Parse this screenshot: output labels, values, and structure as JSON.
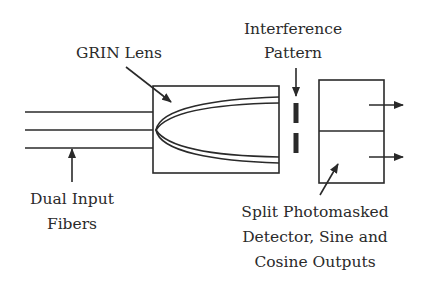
{
  "diagram": {
    "labels": {
      "grin_lens": "GRIN Lens",
      "interference_line1": "Interference",
      "interference_line2": "Pattern",
      "fibers_line1": "Dual Input",
      "fibers_line2": "Fibers",
      "detector_line1": "Split Photomasked",
      "detector_line2": "Detector, Sine and",
      "detector_line3": "Cosine Outputs"
    },
    "colors": {
      "stroke": "#2a2a2a",
      "background": "#ffffff"
    },
    "components": [
      "dual-input-fibers",
      "grin-lens",
      "interference-pattern",
      "split-photomasked-detector",
      "sine-output",
      "cosine-output"
    ]
  }
}
